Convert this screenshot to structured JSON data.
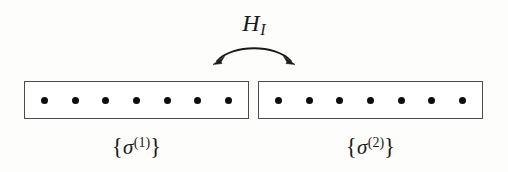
{
  "figure": {
    "type": "diagram",
    "background_color": "#fdfdfc",
    "line_color": "#4a4a4a",
    "dot_color": "#0d0d0d",
    "text_color": "#1a1a1a",
    "width": 508,
    "height": 172
  },
  "interaction": {
    "symbol": "H",
    "subscript": "I",
    "full_label": "H_I",
    "arrow": {
      "name": "double-headed-curved-arrow",
      "direction": "bidirectional",
      "curvature": "arc-upward",
      "left_arrowhead": "points-down-left",
      "right_arrowhead": "points-down-right"
    }
  },
  "chains": [
    {
      "id": "chain-1",
      "side": "left",
      "site_count": 7,
      "label": {
        "open_brace": "{",
        "symbol": "σ",
        "superscript": "(1)",
        "close_brace": "}",
        "full": "{σ^(1)}"
      }
    },
    {
      "id": "chain-2",
      "side": "right",
      "site_count": 7,
      "label": {
        "open_brace": "{",
        "symbol": "σ",
        "superscript": "(2)",
        "close_brace": "}",
        "full": "{σ^(2)}"
      }
    }
  ]
}
